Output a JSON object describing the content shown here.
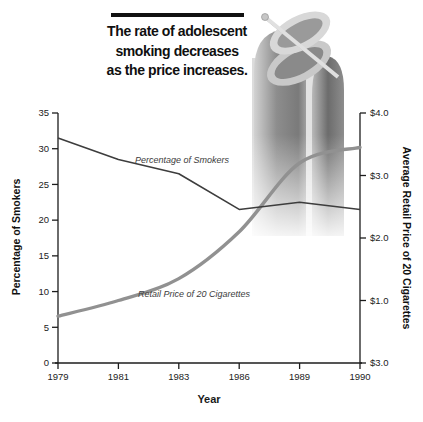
{
  "header": {
    "title_lines": [
      "The rate of adolescent",
      "smoking decreases",
      "as the price increases."
    ]
  },
  "decoration": {
    "dollar_sign_icon": "$"
  },
  "chart_data": {
    "type": "line",
    "x": [
      1979,
      1981,
      1983,
      1986,
      1989,
      1990
    ],
    "x_tick_labels": [
      "1979",
      "1981",
      "1983",
      "1986",
      "1989",
      "1990"
    ],
    "xlabel": "Year",
    "series": [
      {
        "name": "Percentage of Smokers",
        "axis": "left",
        "style": "thin-dark",
        "values": [
          31.5,
          28.5,
          26.5,
          21.5,
          22.5,
          21.5
        ]
      },
      {
        "name": "Retail Price of 20 Cigarettes",
        "axis": "right",
        "style": "thick-gray-smooth",
        "values": [
          0.75,
          1.0,
          1.35,
          2.1,
          3.2,
          3.45
        ]
      }
    ],
    "left_axis": {
      "label": "Percentage of Smokers",
      "ticks": [
        35,
        30,
        25,
        20,
        15,
        10,
        5,
        0
      ],
      "range": [
        0,
        35
      ]
    },
    "right_axis": {
      "label": "Average Retail Price of 20 Cigarettes",
      "tick_labels_top_to_bottom": [
        "$4.0",
        "$3.0",
        "$2.0",
        "$1.0",
        "$3.0"
      ],
      "tick_values": [
        4,
        3,
        2,
        1,
        0
      ],
      "range": [
        0,
        4
      ]
    },
    "grid": "off",
    "legend": "inline-annotations",
    "colors": {
      "smokers_line": "#3d3d3d",
      "price_line": "#919191",
      "axis": "#1c1c1c",
      "tick_text": "#222222"
    }
  }
}
